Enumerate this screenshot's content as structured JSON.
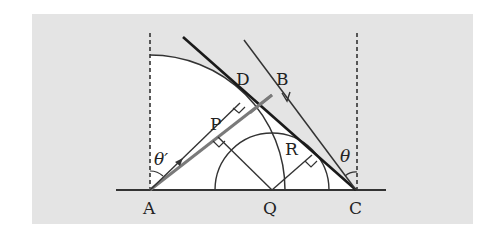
{
  "diagram": {
    "type": "geometry",
    "colors": {
      "panel_background": "#e4e4e4",
      "white_region": "#ffffff",
      "ink": "#222222",
      "gray_ray": "#7a7a7a"
    },
    "points": {
      "A": "A",
      "B": "B",
      "C": "C",
      "D": "D",
      "P": "P",
      "Q": "Q",
      "R": "R"
    },
    "angles": {
      "theta_prime": "θ′",
      "theta": "θ"
    },
    "relations": [
      "AD ⊥ DC (right angle at D)",
      "QP ⊥ AB (right angle at P)",
      "QR ⊥ DC (right angle at R)",
      "θ′ measured between vertical at A and ray AD",
      "θ measured between vertical at C and line CB"
    ]
  }
}
